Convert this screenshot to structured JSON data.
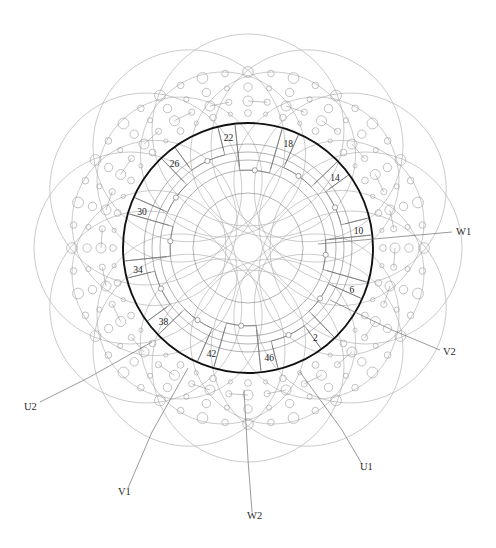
{
  "diagram": {
    "kind": "stator-winding-layout",
    "title": "",
    "geometry": {
      "center_x": 248,
      "center_y": 248,
      "bore_radius": 125,
      "slot_count": 48,
      "inner_ring_radii": [
        55,
        78,
        88,
        96,
        104
      ],
      "end_winding_outer_radius": 215,
      "conductor_band_radii": [
        132,
        142,
        152,
        162,
        172
      ],
      "big_loop_radius": 96,
      "big_loop_center_radius": 118,
      "big_loop_count": 12
    },
    "colors": {
      "bore_stroke": "#111111",
      "thin_stroke": "#8a8a8a",
      "mid_stroke": "#6e6e6e",
      "light_stroke": "#a8a8a8",
      "conductor_stroke": "#9a9a9a",
      "text": "#1a1a1a",
      "background": "#ffffff"
    },
    "stroke_widths": {
      "bore": 1.9,
      "coil": 0.65,
      "loop": 0.6,
      "lead": 0.7,
      "conductor": 0.6
    }
  },
  "slot_labels": [
    {
      "name": "slot-2",
      "text": "2",
      "slot": 2,
      "angle_deg": 53,
      "radius": 112,
      "dx": 0,
      "dy": 0
    },
    {
      "name": "slot-6",
      "text": "6",
      "slot": 6,
      "angle_deg": 22,
      "radius": 112,
      "dx": 0,
      "dy": 0
    },
    {
      "name": "slot-10",
      "text": "10",
      "slot": 10,
      "angle_deg": -9,
      "radius": 112,
      "dx": 0,
      "dy": 0
    },
    {
      "name": "slot-14",
      "text": "14",
      "slot": 14,
      "angle_deg": -39,
      "radius": 112,
      "dx": 0,
      "dy": 0
    },
    {
      "name": "slot-18",
      "text": "18",
      "slot": 18,
      "angle_deg": -69,
      "radius": 112,
      "dx": 0,
      "dy": 0
    },
    {
      "name": "slot-22",
      "text": "22",
      "slot": 22,
      "angle_deg": -100,
      "radius": 112,
      "dx": 0,
      "dy": 0
    },
    {
      "name": "slot-26",
      "text": "26",
      "slot": 26,
      "angle_deg": -131,
      "radius": 112,
      "dx": 0,
      "dy": 0
    },
    {
      "name": "slot-30",
      "text": "30",
      "slot": 30,
      "angle_deg": -161,
      "radius": 112,
      "dx": 0,
      "dy": 0
    },
    {
      "name": "slot-34",
      "text": "34",
      "slot": 34,
      "angle_deg": 169,
      "radius": 112,
      "dx": 0,
      "dy": 0
    },
    {
      "name": "slot-38",
      "text": "38",
      "slot": 38,
      "angle_deg": 139,
      "radius": 112,
      "dx": 0,
      "dy": 0
    },
    {
      "name": "slot-42",
      "text": "42",
      "slot": 42,
      "angle_deg": 109,
      "radius": 112,
      "dx": 0,
      "dy": 0
    },
    {
      "name": "slot-46",
      "text": "46",
      "slot": 46,
      "angle_deg": 79,
      "radius": 112,
      "dx": 0,
      "dy": 0
    }
  ],
  "terminals": [
    {
      "name": "terminal-w1",
      "text": "W1",
      "label_x": 456,
      "label_y": 235,
      "anchor": "start",
      "line": [
        [
          452,
          232
        ],
        [
          396,
          237
        ],
        [
          318,
          244
        ]
      ]
    },
    {
      "name": "terminal-v2",
      "text": "V2",
      "label_x": 443,
      "label_y": 355,
      "anchor": "start",
      "line": [
        [
          440,
          350
        ],
        [
          392,
          330
        ],
        [
          330,
          300
        ]
      ]
    },
    {
      "name": "terminal-u1",
      "text": "U1",
      "label_x": 360,
      "label_y": 470,
      "anchor": "start",
      "line": [
        [
          362,
          464
        ],
        [
          342,
          430
        ],
        [
          300,
          372
        ]
      ]
    },
    {
      "name": "terminal-w2",
      "text": "W2",
      "label_x": 247,
      "label_y": 519,
      "anchor": "start",
      "line": [
        [
          252,
          512
        ],
        [
          248,
          460
        ],
        [
          244,
          390
        ]
      ]
    },
    {
      "name": "terminal-v1",
      "text": "V1",
      "label_x": 118,
      "label_y": 495,
      "anchor": "start",
      "line": [
        [
          128,
          488
        ],
        [
          152,
          432
        ],
        [
          188,
          368
        ]
      ]
    },
    {
      "name": "terminal-u2",
      "text": "U2",
      "label_x": 24,
      "label_y": 410,
      "anchor": "start",
      "line": [
        [
          40,
          402
        ],
        [
          88,
          378
        ],
        [
          152,
          342
        ]
      ]
    }
  ],
  "coil_groups": [
    {
      "name": "coil-group-1",
      "start_angle_deg": -96,
      "span_deg": 22,
      "tier": 0
    },
    {
      "name": "coil-group-2",
      "start_angle_deg": -66,
      "span_deg": 22,
      "tier": 1
    },
    {
      "name": "coil-group-3",
      "start_angle_deg": -36,
      "span_deg": 22,
      "tier": 2
    },
    {
      "name": "coil-group-4",
      "start_angle_deg": -6,
      "span_deg": 22,
      "tier": 0
    },
    {
      "name": "coil-group-5",
      "start_angle_deg": 24,
      "span_deg": 22,
      "tier": 1
    },
    {
      "name": "coil-group-6",
      "start_angle_deg": 54,
      "span_deg": 22,
      "tier": 2
    },
    {
      "name": "coil-group-7",
      "start_angle_deg": 84,
      "span_deg": 22,
      "tier": 0
    },
    {
      "name": "coil-group-8",
      "start_angle_deg": 114,
      "span_deg": 22,
      "tier": 1
    },
    {
      "name": "coil-group-9",
      "start_angle_deg": 144,
      "span_deg": 22,
      "tier": 2
    },
    {
      "name": "coil-group-10",
      "start_angle_deg": 174,
      "span_deg": 22,
      "tier": 0
    },
    {
      "name": "coil-group-11",
      "start_angle_deg": -156,
      "span_deg": 22,
      "tier": 1
    },
    {
      "name": "coil-group-12",
      "start_angle_deg": -126,
      "span_deg": 22,
      "tier": 2
    }
  ],
  "conductor_rings": [
    {
      "name": "conductor-ring-outer",
      "radius": 176,
      "count": 48,
      "dot_radius": 5.4
    },
    {
      "name": "conductor-ring-mid",
      "radius": 161,
      "count": 48,
      "dot_radius": 4.2
    },
    {
      "name": "conductor-ring-inner",
      "radius": 147,
      "count": 48,
      "dot_radius": 5.0
    },
    {
      "name": "conductor-ring-core",
      "radius": 135,
      "count": 48,
      "dot_radius": 3.4
    }
  ]
}
